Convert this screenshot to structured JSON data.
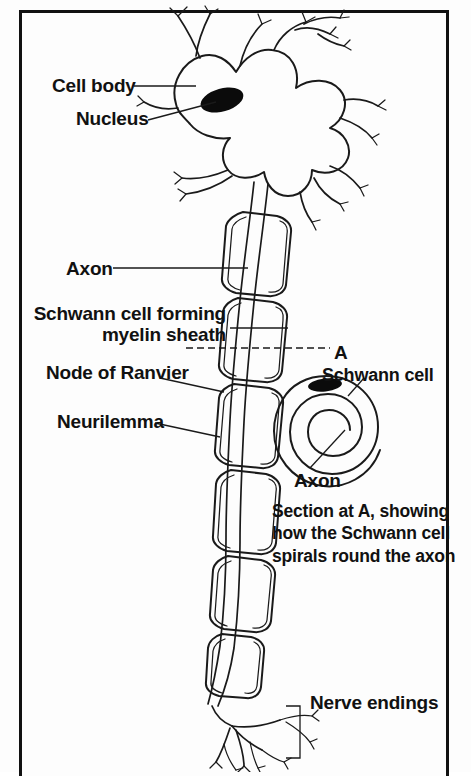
{
  "figure": {
    "type": "biological-diagram",
    "background_color": "#fdfdfd",
    "ink_color": "#111111",
    "frame": {
      "border_color": "#111111",
      "border_width_px": 3
    }
  },
  "labels": {
    "cell_body": "Cell body",
    "nucleus": "Nucleus",
    "axon": "Axon",
    "schwann_cell_forming": "Schwann cell forming\nmyelin sheath",
    "node_of_ranvier": "Node of Ranvier",
    "neurilemma": "Neurilemma",
    "section_marker": "A",
    "schwann_cell": "Schwann cell",
    "axon_inset": "Axon",
    "caption": "Section at A, showing\nhow the Schwann cell\nspirals round the axon",
    "nerve_endings": "Nerve endings"
  },
  "structures": [
    {
      "name": "cell-body",
      "description": "Irregular soma with multiple dendrites"
    },
    {
      "name": "nucleus",
      "description": "Solid black ellipse inside the cell body"
    },
    {
      "name": "dendrites",
      "count": 6,
      "description": "Branching processes radiating from soma"
    },
    {
      "name": "axon",
      "description": "Long fibre running down the centre of the figure"
    },
    {
      "name": "myelin-sheath",
      "segments": 8,
      "description": "Rounded rectangular Schwann cell segments wrapping the axon"
    },
    {
      "name": "nodes-of-ranvier",
      "count": 7,
      "description": "Gaps between adjacent myelin segments"
    },
    {
      "name": "neurilemma",
      "description": "Outer membrane of the Schwann cell"
    },
    {
      "name": "nerve-endings",
      "description": "Terminal arborisation at the foot of the axon"
    },
    {
      "name": "cross-section-inset",
      "description": "Spiral showing Schwann cell wound round the axon"
    }
  ]
}
